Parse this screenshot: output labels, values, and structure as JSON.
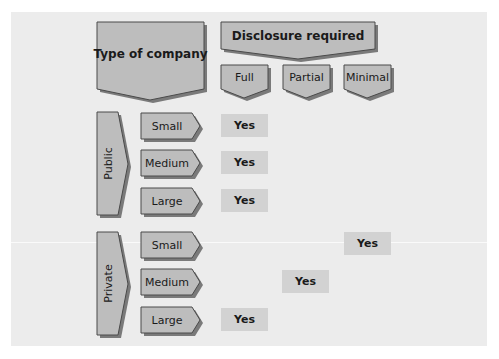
{
  "colors": {
    "panel_bg": "#ececec",
    "shape_fill": "#bdbdbd",
    "shape_stroke": "#4a4a4a",
    "shadow": "#7a7a7a",
    "yes_cell_bg": "#d2d2d2",
    "text": "#1a1a1a"
  },
  "header": {
    "row_header": "Type of company",
    "column_header": "Disclosure required",
    "columns": [
      "Full",
      "Partial",
      "Minimal"
    ]
  },
  "groups": [
    {
      "label": "Public",
      "rows": [
        {
          "size": "Small",
          "full": "Yes",
          "partial": "",
          "minimal": ""
        },
        {
          "size": "Medium",
          "full": "Yes",
          "partial": "",
          "minimal": ""
        },
        {
          "size": "Large",
          "full": "Yes",
          "partial": "",
          "minimal": ""
        }
      ]
    },
    {
      "label": "Private",
      "rows": [
        {
          "size": "Small",
          "full": "",
          "partial": "",
          "minimal": "Yes"
        },
        {
          "size": "Medium",
          "full": "",
          "partial": "Yes",
          "minimal": ""
        },
        {
          "size": "Large",
          "full": "Yes",
          "partial": "",
          "minimal": ""
        }
      ]
    }
  ]
}
